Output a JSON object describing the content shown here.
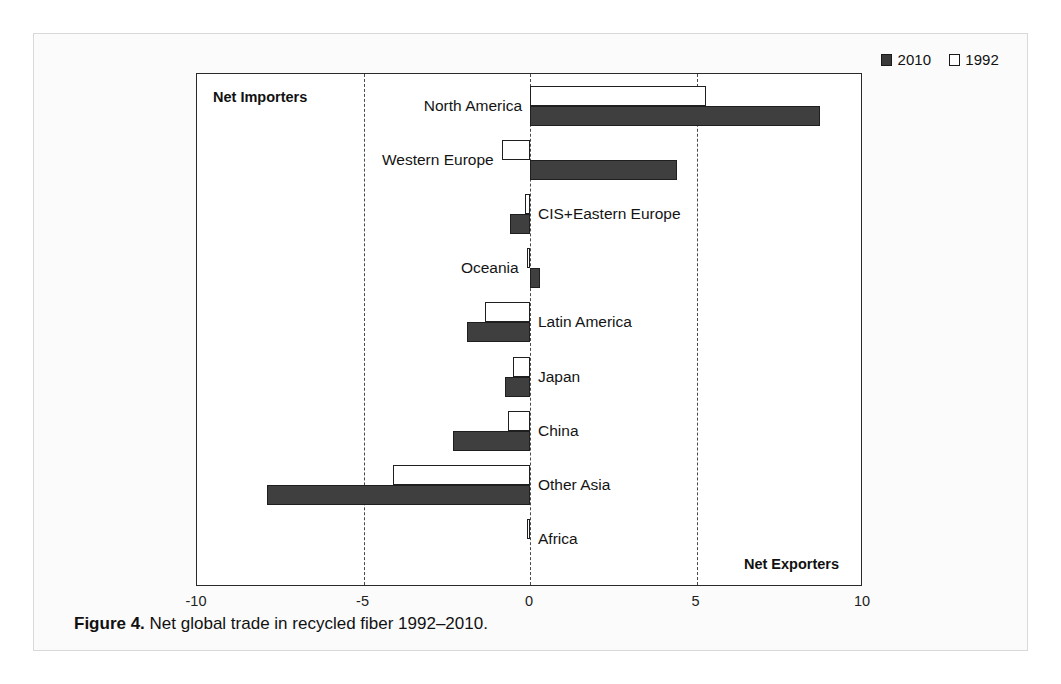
{
  "figure": {
    "caption_label": "Figure 4.",
    "caption_text": " Net global trade in recycled fiber 1992–2010."
  },
  "legend": {
    "position": "top-right",
    "entries": [
      {
        "label": "2010",
        "swatch": "filled-square",
        "color": "#3f3f3f"
      },
      {
        "label": "1992",
        "swatch": "hollow-square",
        "color": "#ffffff"
      }
    ]
  },
  "annotations": {
    "net_importers": "Net Importers",
    "net_exporters": "Net Exporters"
  },
  "axis": {
    "tick_labels": [
      "-10",
      "-5",
      "0",
      "5",
      "10"
    ],
    "tick_values": [
      -10,
      -5,
      0,
      5,
      10
    ]
  },
  "chart_data": {
    "type": "bar",
    "orientation": "horizontal",
    "title": "Net global trade in recycled fiber 1992–2010",
    "xlabel": "",
    "ylabel": "",
    "xlim": [
      -10,
      10
    ],
    "xticks": [
      -10,
      -5,
      0,
      5,
      10
    ],
    "grid": true,
    "gridlines_at": [
      -5,
      0,
      5
    ],
    "legend_position": "top-right",
    "categories": [
      "North America",
      "Western Europe",
      "CIS+Eastern Europe",
      "Oceania",
      "Latin America",
      "Japan",
      "China",
      "Other Asia",
      "Africa"
    ],
    "series": [
      {
        "name": "1992",
        "color": "#ffffff",
        "values": [
          5.3,
          -0.85,
          -0.15,
          -0.1,
          -1.35,
          -0.5,
          -0.65,
          -4.1,
          -0.1
        ]
      },
      {
        "name": "2010",
        "color": "#3f3f3f",
        "values": [
          8.7,
          4.4,
          -0.6,
          0.3,
          -1.9,
          -0.75,
          -2.3,
          -7.9,
          0.0
        ]
      }
    ],
    "annotations": [
      "Net Importers",
      "Net Exporters"
    ]
  },
  "labels": {
    "label_sides": [
      "left",
      "left",
      "right",
      "left",
      "right",
      "right",
      "right",
      "right",
      "right"
    ]
  }
}
